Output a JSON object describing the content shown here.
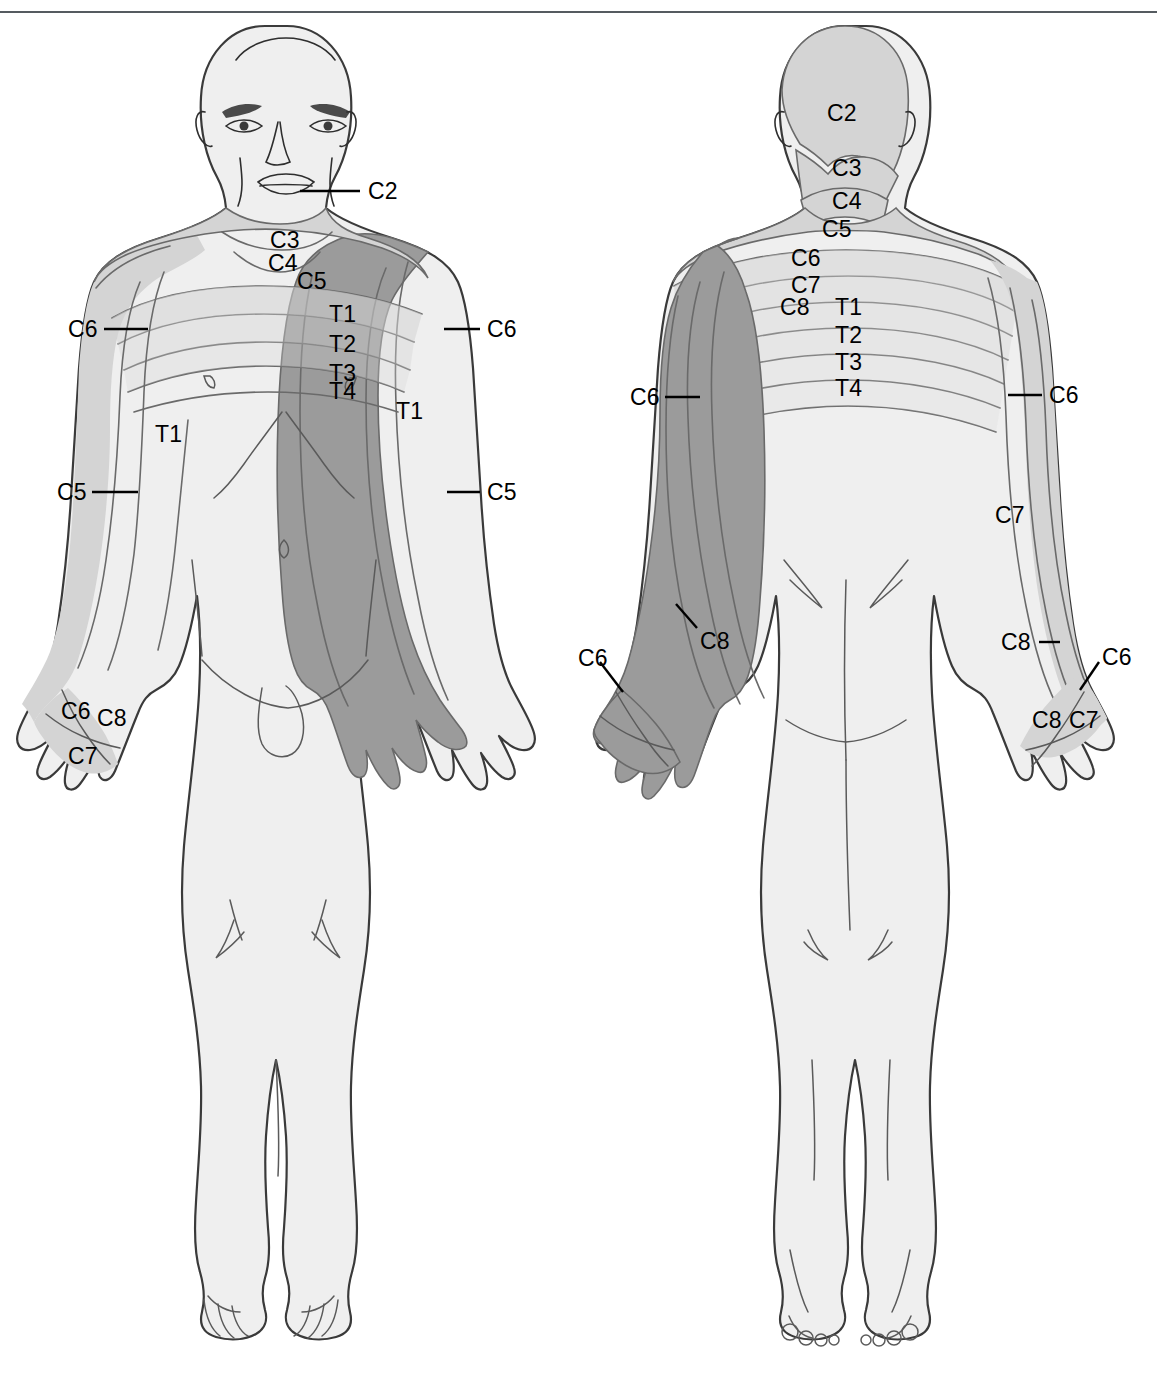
{
  "diagram": {
    "type": "anatomical-dermatome-chart",
    "views": [
      "anterior",
      "posterior"
    ],
    "colors": {
      "background": "#ffffff",
      "skin_base": "#f0f0f0",
      "dermatome_light": "#d4d4d4",
      "dermatome_mid": "#c9c9c9",
      "dermatome_dark": "#9b9b9b",
      "outline": "#3a3a3a",
      "label_text": "#000000",
      "rule": "#555b60"
    }
  },
  "anterior": {
    "view_name": "anterior",
    "labels": [
      {
        "id": "ant-c2",
        "text": "C2",
        "x": 368,
        "y": 180,
        "leader": {
          "x1": 300,
          "y1": 191,
          "x2": 360,
          "y2": 191
        }
      },
      {
        "id": "ant-c3",
        "text": "C3",
        "x": 270,
        "y": 229,
        "leader": null
      },
      {
        "id": "ant-c4",
        "text": "C4",
        "x": 268,
        "y": 252,
        "leader": null
      },
      {
        "id": "ant-c5-neck",
        "text": "C5",
        "x": 297,
        "y": 270,
        "leader": null
      },
      {
        "id": "ant-t1-chest",
        "text": "T1",
        "x": 329,
        "y": 303,
        "leader": null
      },
      {
        "id": "ant-t2-chest",
        "text": "T2",
        "x": 329,
        "y": 333,
        "leader": null
      },
      {
        "id": "ant-t3-chest",
        "text": "T3",
        "x": 329,
        "y": 362,
        "leader": null
      },
      {
        "id": "ant-t4-chest",
        "text": "T4",
        "x": 329,
        "y": 380,
        "leader": null
      },
      {
        "id": "ant-c6-left",
        "text": "C6",
        "x": 68,
        "y": 318,
        "leader": {
          "x1": 104,
          "y1": 329,
          "x2": 148,
          "y2": 329
        }
      },
      {
        "id": "ant-c5-left",
        "text": "C5",
        "x": 57,
        "y": 481,
        "leader": {
          "x1": 92,
          "y1": 492,
          "x2": 138,
          "y2": 492
        }
      },
      {
        "id": "ant-t1-left",
        "text": "T1",
        "x": 155,
        "y": 423,
        "leader": null
      },
      {
        "id": "ant-c6-right",
        "text": "C6",
        "x": 487,
        "y": 318,
        "leader": {
          "x1": 444,
          "y1": 329,
          "x2": 480,
          "y2": 329
        }
      },
      {
        "id": "ant-c5-right",
        "text": "C5",
        "x": 487,
        "y": 481,
        "leader": {
          "x1": 447,
          "y1": 492,
          "x2": 480,
          "y2": 492
        }
      },
      {
        "id": "ant-t1-right",
        "text": "T1",
        "x": 396,
        "y": 400,
        "leader": null
      },
      {
        "id": "ant-c6-hand",
        "text": "C6",
        "x": 61,
        "y": 700,
        "leader": null
      },
      {
        "id": "ant-c8-hand",
        "text": "C8",
        "x": 97,
        "y": 707,
        "leader": null
      },
      {
        "id": "ant-c7-hand",
        "text": "C7",
        "x": 68,
        "y": 745,
        "leader": null
      }
    ]
  },
  "posterior": {
    "view_name": "posterior",
    "labels": [
      {
        "id": "post-c2",
        "text": "C2",
        "x": 827,
        "y": 102,
        "leader": null
      },
      {
        "id": "post-c3",
        "text": "C3",
        "x": 832,
        "y": 157,
        "leader": null
      },
      {
        "id": "post-c4",
        "text": "C4",
        "x": 832,
        "y": 190,
        "leader": null
      },
      {
        "id": "post-c5",
        "text": "C5",
        "x": 822,
        "y": 218,
        "leader": null
      },
      {
        "id": "post-c6-nape",
        "text": "C6",
        "x": 791,
        "y": 247,
        "leader": null
      },
      {
        "id": "post-c7-nape",
        "text": "C7",
        "x": 791,
        "y": 274,
        "leader": null
      },
      {
        "id": "post-c8-nape",
        "text": "C8",
        "x": 780,
        "y": 296,
        "leader": null
      },
      {
        "id": "post-t1-back",
        "text": "T1",
        "x": 835,
        "y": 296,
        "leader": null
      },
      {
        "id": "post-t2-back",
        "text": "T2",
        "x": 835,
        "y": 324,
        "leader": null
      },
      {
        "id": "post-t3-back",
        "text": "T3",
        "x": 835,
        "y": 351,
        "leader": null
      },
      {
        "id": "post-t4-back",
        "text": "T4",
        "x": 835,
        "y": 377,
        "leader": null
      },
      {
        "id": "post-c6-left",
        "text": "C6",
        "x": 630,
        "y": 386,
        "leader": {
          "x1": 665,
          "y1": 397,
          "x2": 700,
          "y2": 397
        }
      },
      {
        "id": "post-c8-left",
        "text": "C8",
        "x": 700,
        "y": 630,
        "leader": {
          "x1": 697,
          "y1": 628,
          "x2": 676,
          "y2": 604,
          "diagonal": true
        }
      },
      {
        "id": "post-c6-lhand",
        "text": "C6",
        "x": 578,
        "y": 647,
        "leader": {
          "x1": 600,
          "y1": 662,
          "x2": 623,
          "y2": 692,
          "diagonal": true
        }
      },
      {
        "id": "post-c6-right",
        "text": "C6",
        "x": 1049,
        "y": 384,
        "leader": {
          "x1": 1008,
          "y1": 395,
          "x2": 1042,
          "y2": 395
        }
      },
      {
        "id": "post-c7-right",
        "text": "C7",
        "x": 995,
        "y": 504,
        "leader": null
      },
      {
        "id": "post-c8-right",
        "text": "C8",
        "x": 1001,
        "y": 631,
        "leader": {
          "x1": 1039,
          "y1": 642,
          "x2": 1060,
          "y2": 642
        }
      },
      {
        "id": "post-c6-rhand",
        "text": "C6",
        "x": 1102,
        "y": 646,
        "leader": {
          "x1": 1099,
          "y1": 662,
          "x2": 1080,
          "y2": 690,
          "diagonal": true
        }
      },
      {
        "id": "post-c8-rhand",
        "text": "C8",
        "x": 1032,
        "y": 709,
        "leader": null
      },
      {
        "id": "post-c7-rhand",
        "text": "C7",
        "x": 1069,
        "y": 709,
        "leader": null
      }
    ]
  },
  "dermatome_levels": [
    "C2",
    "C3",
    "C4",
    "C5",
    "C6",
    "C7",
    "C8",
    "T1",
    "T2",
    "T3",
    "T4"
  ]
}
